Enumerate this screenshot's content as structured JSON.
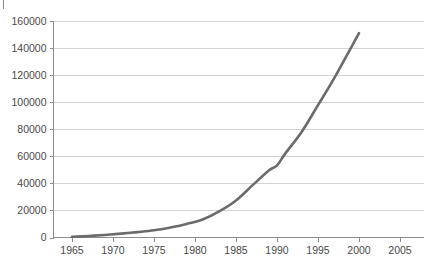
{
  "chart_data": {
    "type": "line",
    "title": "",
    "subtitle": "",
    "xlabel": "",
    "ylabel": "",
    "xlim": [
      1963,
      2007
    ],
    "ylim": [
      0,
      160000
    ],
    "grid": true,
    "legend": null,
    "legend_position": "none",
    "x_ticks": [
      1965,
      1970,
      1975,
      1980,
      1985,
      1990,
      1995,
      2000,
      2005
    ],
    "x_tick_labels": [
      "1965",
      "1970",
      "1975",
      "1980",
      "1985",
      "1990",
      "1995",
      "2000",
      "2005"
    ],
    "y_ticks": [
      0,
      20000,
      40000,
      60000,
      80000,
      100000,
      120000,
      140000,
      160000
    ],
    "y_tick_labels": [
      "0",
      "20000",
      "40000",
      "60000",
      "80000",
      "100000",
      "120000",
      "140000",
      "160000"
    ],
    "series": [
      {
        "name": "series-1",
        "color": "#6b6b6b",
        "line_width": 2.6,
        "x": [
          1965,
          1967,
          1969,
          1971,
          1973,
          1975,
          1977,
          1979,
          1981,
          1983,
          1985,
          1987,
          1989,
          1990,
          1991,
          1993,
          1995,
          1997,
          1999,
          2000
        ],
        "values": [
          500,
          1100,
          1900,
          2900,
          4000,
          5300,
          7400,
          10000,
          13500,
          19500,
          27400,
          38500,
          49500,
          53300,
          62000,
          78000,
          97800,
          118000,
          140000,
          151000
        ]
      }
    ],
    "annotations": []
  },
  "axes": {
    "y_axis_color": "#8c8c8c",
    "x_axis_color": "#8c8c8c",
    "gridline_color": "#c8c8c8",
    "background": "#ffffff"
  },
  "marks": {
    "top_left_tick": "corner-tick-mark"
  }
}
